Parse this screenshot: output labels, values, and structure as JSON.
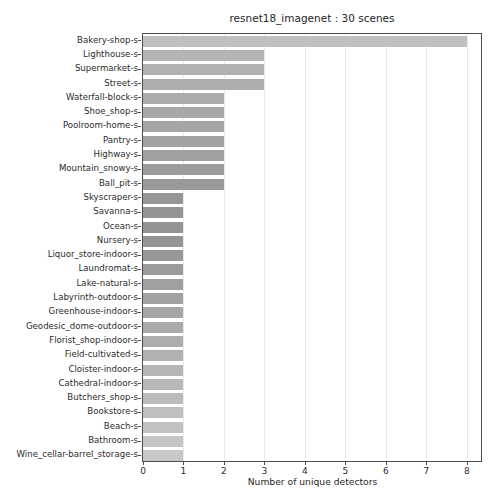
{
  "chart_data": {
    "type": "bar",
    "orientation": "horizontal",
    "title": "resnet18_imagenet : 30 scenes",
    "xlabel": "Number of unique detectors",
    "ylabel": "",
    "xlim": [
      0,
      8.35
    ],
    "ylim_categories": 30,
    "grid": "vertical-only",
    "legend": null,
    "xticks": [
      0,
      1,
      2,
      3,
      4,
      5,
      6,
      7,
      8
    ],
    "xticklabels": [
      "0",
      "1",
      "2",
      "3",
      "4",
      "5",
      "6",
      "7",
      "8"
    ],
    "categories": [
      "Bakery-shop-s",
      "Lighthouse-s",
      "Supermarket-s",
      "Street-s",
      "Waterfall-block-s",
      "Shoe_shop-s",
      "Poolroom-home-s",
      "Pantry-s",
      "Highway-s",
      "Mountain_snowy-s",
      "Ball_pit-s",
      "Skyscraper-s",
      "Savanna-s",
      "Ocean-s",
      "Nursery-s",
      "Liquor_store-indoor-s",
      "Laundromat-s",
      "Lake-natural-s",
      "Labyrinth-outdoor-s",
      "Greenhouse-indoor-s",
      "Geodesic_dome-outdoor-s",
      "Florist_shop-indoor-s",
      "Field-cultivated-s",
      "Cloister-indoor-s",
      "Cathedral-indoor-s",
      "Butchers_shop-s",
      "Bookstore-s",
      "Beach-s",
      "Bathroom-s",
      "Wine_cellar-barrel_storage-s"
    ],
    "values": [
      8,
      3,
      3,
      3,
      2,
      2,
      2,
      2,
      2,
      2,
      2,
      1,
      1,
      1,
      1,
      1,
      1,
      1,
      1,
      1,
      1,
      1,
      1,
      1,
      1,
      1,
      1,
      1,
      1,
      1
    ],
    "bar_colors": [
      "#c0c0c0",
      "#b4b4b4",
      "#b1b1b1",
      "#aeaeae",
      "#ababab",
      "#a8a8a8",
      "#a5a5a5",
      "#a2a2a2",
      "#9f9f9f",
      "#9c9c9c",
      "#999999",
      "#969696",
      "#949494",
      "#939393",
      "#959595",
      "#989898",
      "#9b9b9b",
      "#9f9f9f",
      "#a2a2a2",
      "#a6a6a6",
      "#aaaaaa",
      "#adadad",
      "#b1b1b1",
      "#b5b5b5",
      "#b8b8b8",
      "#bbbbbb",
      "#bfbfbf",
      "#c2c2c2",
      "#c5c5c5",
      "#c8c8c8"
    ],
    "axis_color": "#4d4d4d",
    "grid_color": "#e9e9ec",
    "background": "#ffffff"
  }
}
